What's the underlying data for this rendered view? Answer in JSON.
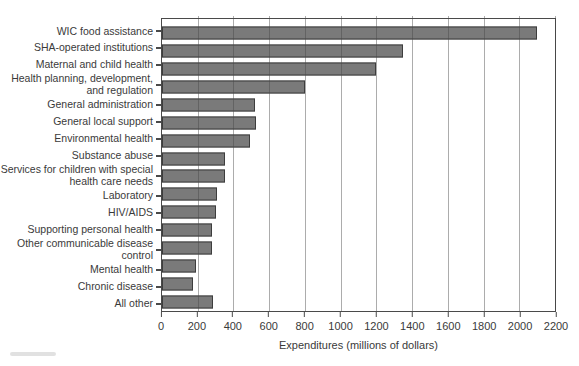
{
  "chart_data": {
    "type": "bar",
    "orientation": "horizontal",
    "title": "",
    "xlabel": "Expenditures (millions of dollars)",
    "ylabel": "",
    "xlim": [
      0,
      2200
    ],
    "xticks": [
      0,
      200,
      400,
      600,
      800,
      1000,
      1200,
      1400,
      1600,
      1800,
      2000,
      2200
    ],
    "grid": true,
    "legend": "none",
    "categories": [
      "WIC food assistance",
      "SHA-operated institutions",
      "Maternal and child health",
      "Health planning, development,\nand regulation",
      "General administration",
      "General local support",
      "Environmental health",
      "Substance abuse",
      "Services for children with special\nhealth care needs",
      "Laboratory",
      "HIV/AIDS",
      "Supporting personal health",
      "Other communicable disease\ncontrol",
      "Mental health",
      "Chronic disease",
      "All other"
    ],
    "values": [
      2100,
      1350,
      1200,
      800,
      520,
      525,
      490,
      355,
      355,
      310,
      300,
      280,
      280,
      190,
      175,
      285
    ]
  },
  "colors": {
    "bar_fill": "#7a7a7a",
    "bar_border": "#3d3d3d",
    "axis": "#4a4a4a",
    "gridline": "rgba(70,70,70,0.45)",
    "text": "#3a3a3a",
    "background": "#ffffff"
  }
}
